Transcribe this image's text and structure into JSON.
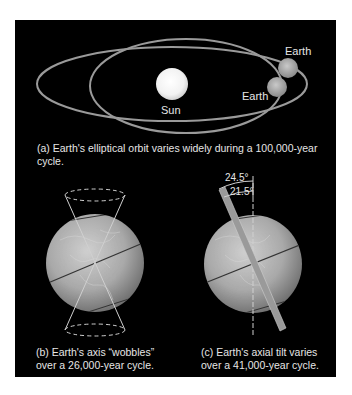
{
  "figure": {
    "panel_a": {
      "sun_label": "Sun",
      "earth_label_upper": "Earth",
      "earth_label_lower": "Earth",
      "caption_line1": "(a) Earth's elliptical orbit varies widely during a 100,000-year",
      "caption_line2": "cycle."
    },
    "panel_b": {
      "caption_line1": "(b) Earth's axis “wobbles”",
      "caption_line2": "over a 26,000-year cycle."
    },
    "panel_c": {
      "angle_outer": "24.5°",
      "angle_inner": "21.5°",
      "caption_line1": "(c) Earth's axial tilt varies",
      "caption_line2": "over a 41,000-year cycle."
    },
    "colors": {
      "background": "#000000",
      "orbit_line": "#9a9a9a",
      "text": "#e6e6e6",
      "globe": "#a8a8a8"
    }
  }
}
